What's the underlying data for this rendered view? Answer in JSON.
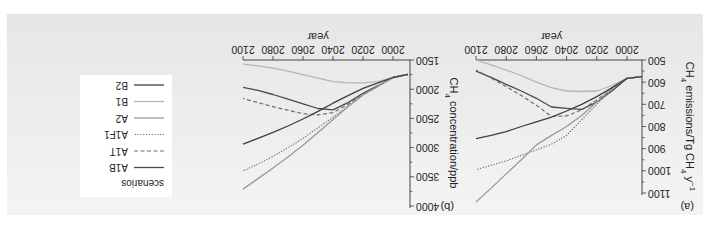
{
  "figure": {
    "orientation": "rotated 180 degrees",
    "panel_background": "#ececec",
    "legend": {
      "title": "scenarios",
      "entries": [
        {
          "name": "A1B",
          "color": "#4a4a4a",
          "dash": "solid"
        },
        {
          "name": "A1T",
          "color": "#6d6d78",
          "dash": "dashed"
        },
        {
          "name": "A1F1",
          "color": "#6d6d78",
          "dash": "dotted"
        },
        {
          "name": "A2",
          "color": "#9a9a9a",
          "dash": "solid"
        },
        {
          "name": "B1",
          "color": "#b5b5b5",
          "dash": "solid"
        },
        {
          "name": "B2",
          "color": "#3e3e3e",
          "dash": "solid"
        }
      ]
    }
  },
  "chart_data": [
    {
      "type": "line",
      "panel_label": "(a)",
      "title": "",
      "xlabel": "year",
      "ylabel": "CH4 emissions/Tg CH4 y^-1",
      "xlim": [
        1990,
        2100
      ],
      "ylim": [
        500,
        1100
      ],
      "xticks": [
        2000,
        2020,
        2040,
        2060,
        2080,
        2100
      ],
      "yticks": [
        500,
        600,
        700,
        800,
        900,
        1000,
        1100
      ],
      "grid": false,
      "x": [
        1990,
        2000,
        2010,
        2020,
        2030,
        2040,
        2050,
        2060,
        2070,
        2080,
        2090,
        2100
      ],
      "series": [
        {
          "name": "A1B",
          "values": [
            575,
            583,
            640,
            690,
            723,
            718,
            712,
            673,
            640,
            610,
            578,
            550
          ]
        },
        {
          "name": "A1T",
          "values": [
            575,
            583,
            630,
            680,
            725,
            752,
            755,
            704,
            660,
            620,
            582,
            545
          ]
        },
        {
          "name": "A1F1",
          "values": [
            575,
            583,
            630,
            700,
            770,
            840,
            880,
            905,
            930,
            955,
            975,
            995
          ]
        },
        {
          "name": "A2",
          "values": [
            575,
            583,
            625,
            690,
            750,
            800,
            840,
            883,
            950,
            1014,
            1078,
            1140
          ]
        },
        {
          "name": "B1",
          "values": [
            575,
            583,
            615,
            640,
            642,
            640,
            625,
            600,
            570,
            545,
            522,
            500
          ]
        },
        {
          "name": "B2",
          "values": [
            575,
            583,
            625,
            665,
            700,
            730,
            758,
            779,
            800,
            823,
            840,
            855
          ]
        }
      ]
    },
    {
      "type": "line",
      "panel_label": "(b)",
      "title": "",
      "xlabel": "year",
      "ylabel": "CH4 concentration/ppb",
      "xlim": [
        1990,
        2100
      ],
      "ylim": [
        1500,
        4000
      ],
      "xticks": [
        2000,
        2020,
        2040,
        2060,
        2080,
        2100
      ],
      "yticks": [
        1500,
        2000,
        2500,
        3000,
        3500,
        4000
      ],
      "grid": false,
      "x": [
        1990,
        2000,
        2010,
        2020,
        2030,
        2040,
        2050,
        2060,
        2070,
        2080,
        2090,
        2100
      ],
      "series": [
        {
          "name": "A1B",
          "values": [
            1745,
            1800,
            1940,
            2070,
            2230,
            2355,
            2330,
            2250,
            2170,
            2090,
            2020,
            1970
          ]
        },
        {
          "name": "A1T",
          "values": [
            1745,
            1800,
            1950,
            2090,
            2260,
            2400,
            2440,
            2420,
            2360,
            2300,
            2230,
            2160
          ]
        },
        {
          "name": "A1F1",
          "values": [
            1745,
            1800,
            1950,
            2100,
            2290,
            2480,
            2660,
            2840,
            3000,
            3150,
            3280,
            3400
          ]
        },
        {
          "name": "A2",
          "values": [
            1745,
            1800,
            1950,
            2100,
            2300,
            2520,
            2740,
            2960,
            3160,
            3350,
            3530,
            3710
          ]
        },
        {
          "name": "B1",
          "values": [
            1745,
            1800,
            1870,
            1890,
            1890,
            1870,
            1810,
            1750,
            1690,
            1640,
            1600,
            1570
          ]
        },
        {
          "name": "B2",
          "values": [
            1745,
            1800,
            1890,
            1985,
            2110,
            2240,
            2380,
            2510,
            2630,
            2740,
            2840,
            2940
          ]
        }
      ]
    }
  ]
}
